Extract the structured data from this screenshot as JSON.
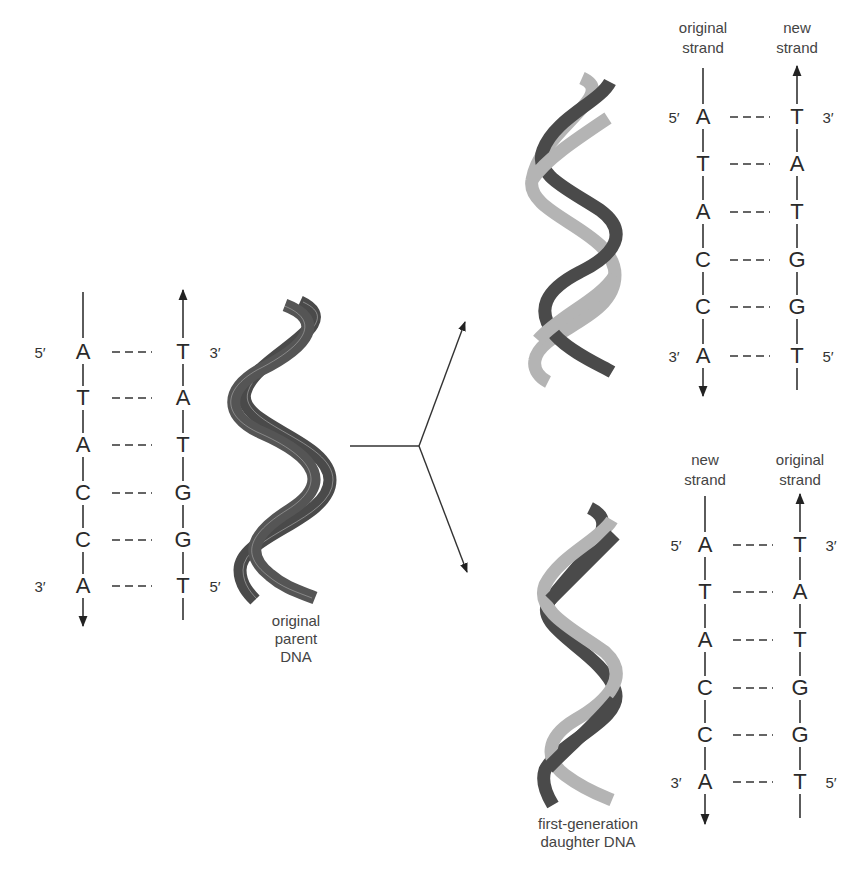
{
  "figure": {
    "colors": {
      "original_strand": "#4a4a4a",
      "new_strand": "#b4b4b4",
      "line": "#333333",
      "text": "#2a2a2a"
    }
  },
  "parent": {
    "caption_lines": [
      "original",
      "parent",
      "DNA"
    ],
    "left_strand": {
      "top_end": "5′",
      "bottom_end": "3′",
      "bases": [
        "A",
        "T",
        "A",
        "C",
        "C",
        "A"
      ]
    },
    "right_strand": {
      "top_end": "3′",
      "bottom_end": "5′",
      "bases": [
        "T",
        "A",
        "T",
        "G",
        "G",
        "T"
      ]
    },
    "bond_symbol": "- - -"
  },
  "daughter_top": {
    "left_header": [
      "original",
      "strand"
    ],
    "right_header": [
      "new",
      "strand"
    ],
    "left_strand": {
      "top_end": "5′",
      "bottom_end": "3′",
      "bases": [
        "A",
        "T",
        "A",
        "C",
        "C",
        "A"
      ]
    },
    "right_strand": {
      "top_end": "3′",
      "bottom_end": "5′",
      "bases": [
        "T",
        "A",
        "T",
        "G",
        "G",
        "T"
      ]
    }
  },
  "daughter_bottom": {
    "left_header": [
      "new",
      "strand"
    ],
    "right_header": [
      "original",
      "strand"
    ],
    "left_strand": {
      "top_end": "5′",
      "bottom_end": "3′",
      "bases": [
        "A",
        "T",
        "A",
        "C",
        "C",
        "A"
      ]
    },
    "right_strand": {
      "top_end": "3′",
      "bottom_end": "5′",
      "bases": [
        "T",
        "A",
        "T",
        "G",
        "G",
        "T"
      ]
    },
    "caption_lines": [
      "first-generation",
      "daughter DNA"
    ]
  }
}
